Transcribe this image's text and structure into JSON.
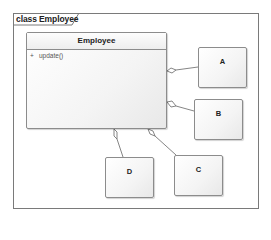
{
  "frame": {
    "label": "class Employee"
  },
  "classes": {
    "employee": {
      "name": "Employee",
      "operations": [
        {
          "visibility": "+",
          "signature": "update()"
        }
      ]
    },
    "a": {
      "name": "A"
    },
    "b": {
      "name": "B"
    },
    "c": {
      "name": "C"
    },
    "d": {
      "name": "D"
    }
  },
  "relationships": [
    {
      "type": "aggregation",
      "whole": "Employee",
      "part": "A"
    },
    {
      "type": "aggregation",
      "whole": "Employee",
      "part": "B"
    },
    {
      "type": "aggregation",
      "whole": "Employee",
      "part": "D"
    },
    {
      "type": "aggregation",
      "whole": "Employee",
      "part": "C"
    }
  ],
  "colors": {
    "border": "#7a7a7a",
    "box_fill": "#f4f4f4",
    "line": "#666666"
  }
}
